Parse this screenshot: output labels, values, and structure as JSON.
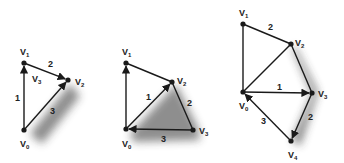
{
  "colors": {
    "stroke": "#1a1a1a",
    "text": "#222222",
    "shadow": "#333333",
    "background": "#ffffff"
  },
  "diagrams": [
    {
      "name": "triangle-3-vertices",
      "vertices": [
        {
          "id": "V0",
          "letter": "V",
          "sub": "0",
          "x": 24,
          "y": 130,
          "lx": 20,
          "ly": 147
        },
        {
          "id": "V1",
          "letter": "V",
          "sub": "1",
          "x": 24,
          "y": 63,
          "lx": 20,
          "ly": 55
        },
        {
          "id": "V2",
          "letter": "V",
          "sub": "2",
          "x": 68,
          "y": 80,
          "lx": 75,
          "ly": 85
        }
      ],
      "inner_label": {
        "letter": "V",
        "sub": "3",
        "x": 32,
        "y": 82
      },
      "edges": [
        {
          "from": "V0",
          "to": "V1",
          "label": "1",
          "lx": 15,
          "ly": 101,
          "arrow": "V1"
        },
        {
          "from": "V1",
          "to": "V2",
          "label": "2",
          "lx": 48,
          "ly": 67,
          "arrow": "V2"
        },
        {
          "from": "V0",
          "to": "V2",
          "label": "3",
          "lx": 50,
          "ly": 114,
          "arrow": "V2"
        }
      ]
    },
    {
      "name": "quad-4-vertices",
      "vertices": [
        {
          "id": "V0",
          "letter": "V",
          "sub": "0",
          "x": 126,
          "y": 129,
          "lx": 122,
          "ly": 147
        },
        {
          "id": "V1",
          "letter": "V",
          "sub": "1",
          "x": 126,
          "y": 63,
          "lx": 122,
          "ly": 55
        },
        {
          "id": "V2",
          "letter": "V",
          "sub": "2",
          "x": 172,
          "y": 82,
          "lx": 177,
          "ly": 84
        },
        {
          "id": "V3",
          "letter": "V",
          "sub": "3",
          "x": 193,
          "y": 130,
          "lx": 199,
          "ly": 134
        }
      ],
      "edges": [
        {
          "from": "V0",
          "to": "V1",
          "label": "",
          "arrow": "V1"
        },
        {
          "from": "V1",
          "to": "V2",
          "label": "",
          "arrow": ""
        },
        {
          "from": "V0",
          "to": "V2",
          "label": "1",
          "lx": 146,
          "ly": 100,
          "arrow": "V2"
        },
        {
          "from": "V2",
          "to": "V3",
          "label": "2",
          "lx": 187,
          "ly": 106,
          "arrow": ""
        },
        {
          "from": "V3",
          "to": "V0",
          "label": "3",
          "lx": 161,
          "ly": 142,
          "arrow": "V0"
        }
      ]
    },
    {
      "name": "pentagon-5-vertices",
      "vertices": [
        {
          "id": "V0",
          "letter": "V",
          "sub": "0",
          "x": 243,
          "y": 92,
          "lx": 239,
          "ly": 109
        },
        {
          "id": "V1",
          "letter": "V",
          "sub": "1",
          "x": 243,
          "y": 24,
          "lx": 239,
          "ly": 16
        },
        {
          "id": "V2",
          "letter": "V",
          "sub": "2",
          "x": 291,
          "y": 44,
          "lx": 295,
          "ly": 46
        },
        {
          "id": "V3",
          "letter": "V",
          "sub": "3",
          "x": 312,
          "y": 93,
          "lx": 318,
          "ly": 97
        },
        {
          "id": "V4",
          "letter": "V",
          "sub": "4",
          "x": 291,
          "y": 141,
          "lx": 288,
          "ly": 158
        }
      ],
      "edges": [
        {
          "from": "V0",
          "to": "V1",
          "label": "",
          "arrow": ""
        },
        {
          "from": "V1",
          "to": "V2",
          "label": "2",
          "lx": 268,
          "ly": 30,
          "arrow": ""
        },
        {
          "from": "V0",
          "to": "V2",
          "label": "",
          "arrow": ""
        },
        {
          "from": "V2",
          "to": "V3",
          "label": "",
          "arrow": ""
        },
        {
          "from": "V0",
          "to": "V3",
          "label": "1",
          "lx": 277,
          "ly": 90,
          "arrow": "V3"
        },
        {
          "from": "V3",
          "to": "V4",
          "label": "2",
          "lx": 308,
          "ly": 120,
          "arrow": "V4"
        },
        {
          "from": "V4",
          "to": "V0",
          "label": "3",
          "lx": 261,
          "ly": 124,
          "arrow": "V0"
        }
      ]
    }
  ]
}
